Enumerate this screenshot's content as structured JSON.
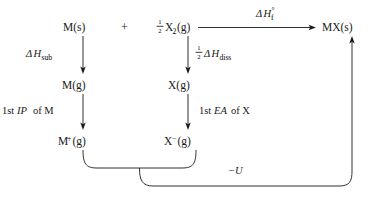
{
  "figure": {
    "name": "born-haber-cycle",
    "ink_color": "#1a1a1a",
    "background_color": "#ffffff"
  },
  "species": {
    "metal_solid": "M(s)",
    "plus": "+",
    "halogen_gas_coef_num": "1",
    "halogen_gas_coef_den": "2",
    "halogen_gas_base": "X",
    "halogen_gas_sub": "2",
    "halogen_gas_state": "(g)",
    "product": "MX(s)",
    "metal_gas": "M(g)",
    "halogen_atom_gas": "X(g)",
    "metal_cation_base": "M",
    "metal_cation_charge": "+",
    "metal_cation_state": "(g)",
    "halide_anion_base": "X",
    "halide_anion_charge": "−",
    "halide_anion_state": "(g)"
  },
  "steps": {
    "sublimation": {
      "delta": "Δ",
      "h": "H",
      "subscript": "sub",
      "full_label": "ΔH_sub"
    },
    "dissociation": {
      "coef_num": "1",
      "coef_den": "2",
      "delta": "Δ",
      "h": "H",
      "subscript": "diss",
      "full_label": "½ΔH_diss"
    },
    "ionization": {
      "prefix": "1st",
      "symbol": "IP",
      "suffix": "of M",
      "full_label": "1st IP of M"
    },
    "electron_affinity": {
      "prefix": "1st",
      "symbol": "EA",
      "suffix": "of X",
      "full_label": "1st EA of X"
    },
    "formation": {
      "delta": "Δ",
      "h": "H",
      "superscript": "°",
      "subscript": "f",
      "full_label": "ΔH°f"
    },
    "lattice": {
      "symbol": "−U",
      "full_label": "−U (negative lattice energy)"
    }
  }
}
